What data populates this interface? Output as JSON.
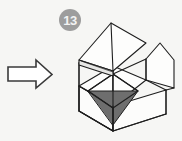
{
  "figure": {
    "background_color": "#f6f6f4",
    "title": "",
    "badge": {
      "label": "13",
      "circle_color": "#9d9d9d",
      "text_color": "#f2f2f2"
    },
    "arrow": {
      "name": "transformation-arrow",
      "direction": "right",
      "fill_color": "#ffffff",
      "stroke_color": "#3a3a3a"
    },
    "box": {
      "name": "open-carton-diagram",
      "description": "Isometric line drawing of an open cardboard box with four outward-folded flaps and a shaded interior triangle",
      "panel_fill": "#fdfdfc",
      "panel_shadow_fill": "#e9e9e7",
      "shaded_triangle_fill": "#6e6e6e",
      "stroke_color": "#1e1e1e",
      "stroke_width": 1.1
    }
  }
}
